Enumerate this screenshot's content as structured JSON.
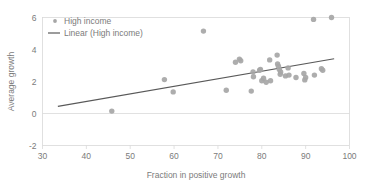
{
  "chart_data": {
    "type": "scatter",
    "title": "",
    "xlabel": "Fraction in positive growth",
    "ylabel": "Average growth",
    "xlim": [
      30,
      100
    ],
    "ylim": [
      -2,
      6
    ],
    "xticks": [
      30,
      40,
      50,
      60,
      70,
      80,
      90,
      100
    ],
    "yticks": [
      -2,
      0,
      2,
      4,
      6
    ],
    "grid": false,
    "legend_position": "top-left",
    "marker_color": "#a6a6a6",
    "line_color": "#595959",
    "series": [
      {
        "name": "High income",
        "type": "scatter",
        "points": [
          [
            45.8,
            0.15
          ],
          [
            57.8,
            2.12
          ],
          [
            59.8,
            1.35
          ],
          [
            66.7,
            5.15
          ],
          [
            71.9,
            1.45
          ],
          [
            74.0,
            3.2
          ],
          [
            74.9,
            3.4
          ],
          [
            75.2,
            3.3
          ],
          [
            77.6,
            1.4
          ],
          [
            78.0,
            2.6
          ],
          [
            78.1,
            2.3
          ],
          [
            79.5,
            2.7
          ],
          [
            79.7,
            2.75
          ],
          [
            80.0,
            2.05
          ],
          [
            80.4,
            2.2
          ],
          [
            81.0,
            1.95
          ],
          [
            81.8,
            3.35
          ],
          [
            82.0,
            2.05
          ],
          [
            83.5,
            3.65
          ],
          [
            83.6,
            3.1
          ],
          [
            83.8,
            2.95
          ],
          [
            84.0,
            2.75
          ],
          [
            84.2,
            2.45
          ],
          [
            84.3,
            2.6
          ],
          [
            85.4,
            2.35
          ],
          [
            86.0,
            2.85
          ],
          [
            86.2,
            2.4
          ],
          [
            87.8,
            2.25
          ],
          [
            89.6,
            2.5
          ],
          [
            89.8,
            2.1
          ],
          [
            90.0,
            2.25
          ],
          [
            91.8,
            5.88
          ],
          [
            92.0,
            2.4
          ],
          [
            93.6,
            2.8
          ],
          [
            93.9,
            2.7
          ],
          [
            95.9,
            6.0
          ]
        ]
      },
      {
        "name": "Linear (High income)",
        "type": "line",
        "points": [
          [
            33.5,
            0.45
          ],
          [
            96.5,
            3.42
          ]
        ]
      }
    ]
  },
  "legend": {
    "entries": [
      {
        "label": "High income",
        "marker": "dot"
      },
      {
        "label": "Linear (High income)",
        "marker": "line"
      }
    ]
  },
  "axes": {
    "x": {
      "title": "Fraction in positive growth",
      "labels": [
        "30",
        "40",
        "50",
        "60",
        "70",
        "80",
        "90",
        "100"
      ]
    },
    "y": {
      "title": "Average growth",
      "labels": [
        "6",
        "4",
        "2",
        "0",
        "-2"
      ]
    }
  }
}
